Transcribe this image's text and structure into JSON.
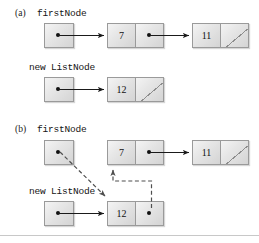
{
  "figure": {
    "background": "#ffffff",
    "divider_color": "#c8c8c8"
  },
  "parts": [
    {
      "id": "a",
      "label": "(a)",
      "caption": "firstNode",
      "caption2": "new ListNode"
    },
    {
      "id": "b",
      "label": "(b)",
      "caption": "firstNode",
      "caption2": "new ListNode"
    }
  ],
  "labels": {
    "part_a": "(a)",
    "part_b": "(b)",
    "first_node_a": "firstNode",
    "new_list_node_a": "new ListNode",
    "first_node_b": "firstNode",
    "new_list_node_b": "new ListNode"
  },
  "nodes": {
    "a_head": {
      "data": "",
      "pointer": "dot",
      "name": "firstNode-reference-a"
    },
    "a_n7": {
      "data": "7",
      "pointer": "dot",
      "name": "node-7-a"
    },
    "a_n11": {
      "data": "11",
      "pointer": "null",
      "name": "node-11-a"
    },
    "a_newref": {
      "data": "",
      "pointer": "dot",
      "name": "new-listnode-reference-a"
    },
    "a_n12": {
      "data": "12",
      "pointer": "null",
      "name": "node-12-a"
    },
    "b_head": {
      "data": "",
      "pointer": "dot",
      "name": "firstNode-reference-b"
    },
    "b_n7": {
      "data": "7",
      "pointer": "dot",
      "name": "node-7-b"
    },
    "b_n11": {
      "data": "11",
      "pointer": "null",
      "name": "node-11-b"
    },
    "b_newref": {
      "data": "",
      "pointer": "dot",
      "name": "new-listnode-reference-b"
    },
    "b_n12": {
      "data": "12",
      "pointer": "dot",
      "name": "node-12-b"
    }
  },
  "values": {
    "seven": "7",
    "eleven": "11",
    "twelve": "12"
  },
  "arrows": {
    "solid_color": "#1a1a1a",
    "dashed_color": "#6a6a6a",
    "a_head_to_7": "solid",
    "a_7_to_11": "solid",
    "a_newref_to_12": "solid",
    "b_newref_to_12": "solid",
    "b_7_to_11": "solid",
    "b_head_to_12": "dashed",
    "b_12_to_7": "dashed"
  }
}
